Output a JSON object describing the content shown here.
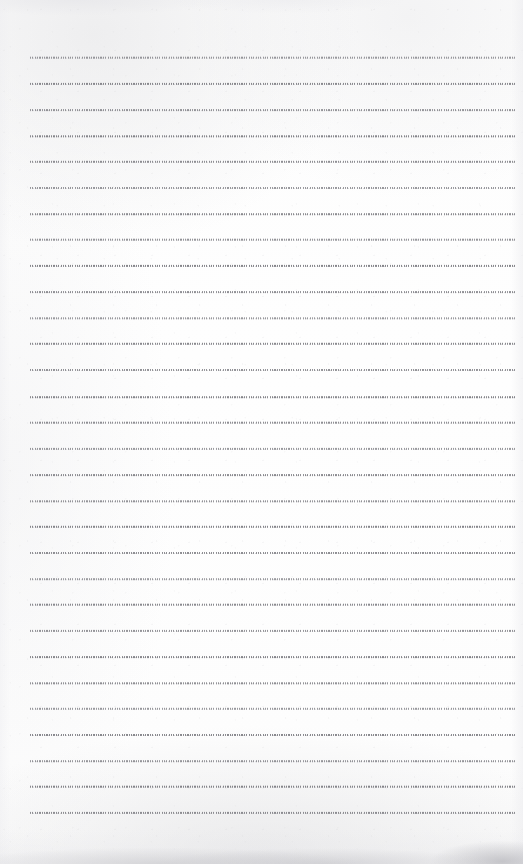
{
  "document": {
    "kind": "scanned-blank-lined-notebook-page",
    "page_width_px": 523,
    "page_height_px": 864,
    "background_color": "#fdfdfd",
    "text_content": "",
    "handwriting_present": "no",
    "printed_text_present": "no"
  },
  "ruling": {
    "style": "dotted",
    "line_color": "#74747a",
    "line_count": 30,
    "first_line_y_px": 57,
    "last_line_y_px": 812,
    "line_spacing_px": 26.03,
    "line_left_x_px": 30,
    "line_right_x_px": 515,
    "line_thickness_px": 1,
    "margin_rule_present": "no",
    "header_rule_present": "no",
    "lines": [
      {
        "index": 1,
        "y": 57,
        "left": 30,
        "right": 515,
        "content": ""
      },
      {
        "index": 2,
        "y": 83,
        "left": 30,
        "right": 515,
        "content": ""
      },
      {
        "index": 3,
        "y": 109,
        "left": 30,
        "right": 515,
        "content": ""
      },
      {
        "index": 4,
        "y": 135,
        "left": 30,
        "right": 515,
        "content": ""
      },
      {
        "index": 5,
        "y": 161,
        "left": 30,
        "right": 515,
        "content": ""
      },
      {
        "index": 6,
        "y": 187,
        "left": 30,
        "right": 515,
        "content": ""
      },
      {
        "index": 7,
        "y": 213,
        "left": 30,
        "right": 515,
        "content": ""
      },
      {
        "index": 8,
        "y": 239,
        "left": 30,
        "right": 515,
        "content": ""
      },
      {
        "index": 9,
        "y": 265,
        "left": 30,
        "right": 515,
        "content": ""
      },
      {
        "index": 10,
        "y": 291,
        "left": 30,
        "right": 515,
        "content": ""
      },
      {
        "index": 11,
        "y": 317,
        "left": 30,
        "right": 515,
        "content": ""
      },
      {
        "index": 12,
        "y": 343,
        "left": 30,
        "right": 515,
        "content": ""
      },
      {
        "index": 13,
        "y": 369,
        "left": 30,
        "right": 515,
        "content": ""
      },
      {
        "index": 14,
        "y": 396,
        "left": 30,
        "right": 515,
        "content": ""
      },
      {
        "index": 15,
        "y": 422,
        "left": 30,
        "right": 515,
        "content": ""
      },
      {
        "index": 16,
        "y": 448,
        "left": 30,
        "right": 515,
        "content": ""
      },
      {
        "index": 17,
        "y": 474,
        "left": 30,
        "right": 515,
        "content": ""
      },
      {
        "index": 18,
        "y": 500,
        "left": 30,
        "right": 515,
        "content": ""
      },
      {
        "index": 19,
        "y": 526,
        "left": 30,
        "right": 515,
        "content": ""
      },
      {
        "index": 20,
        "y": 552,
        "left": 30,
        "right": 515,
        "content": ""
      },
      {
        "index": 21,
        "y": 578,
        "left": 30,
        "right": 515,
        "content": ""
      },
      {
        "index": 22,
        "y": 604,
        "left": 30,
        "right": 515,
        "content": ""
      },
      {
        "index": 23,
        "y": 630,
        "left": 30,
        "right": 515,
        "content": ""
      },
      {
        "index": 24,
        "y": 656,
        "left": 30,
        "right": 515,
        "content": ""
      },
      {
        "index": 25,
        "y": 682,
        "left": 30,
        "right": 515,
        "content": ""
      },
      {
        "index": 26,
        "y": 708,
        "left": 30,
        "right": 515,
        "content": ""
      },
      {
        "index": 27,
        "y": 734,
        "left": 30,
        "right": 515,
        "content": ""
      },
      {
        "index": 28,
        "y": 760,
        "left": 30,
        "right": 515,
        "content": ""
      },
      {
        "index": 29,
        "y": 786,
        "left": 30,
        "right": 515,
        "content": ""
      },
      {
        "index": 30,
        "y": 812,
        "left": 30,
        "right": 515,
        "content": ""
      }
    ]
  },
  "scan_artifacts": {
    "top_edge_shading": "faint",
    "bottom_edge_shading": "faint-gray-smudge",
    "left_edge_shading": "faint",
    "right_edge_shading": "faint"
  }
}
